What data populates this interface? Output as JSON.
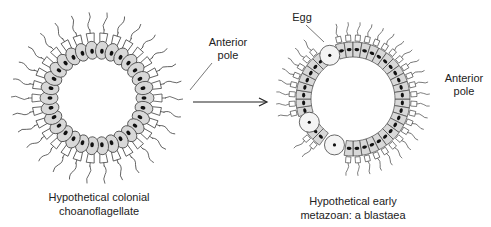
{
  "diagram": {
    "left_panel": {
      "caption_line1": "Hypothetical colonial",
      "caption_line2": "choanoflagellate",
      "label_anterior_line1": "Anterior",
      "label_anterior_line2": "pole",
      "ring": {
        "cx": 97,
        "cy": 98,
        "radius": 46,
        "cell_count": 30
      }
    },
    "arrow": {
      "x1": 193,
      "y1": 102,
      "x2": 266,
      "y2": 102,
      "direction": "right"
    },
    "right_panel": {
      "caption_line1": "Hypothetical early",
      "caption_line2": "metazoan: a blastaea",
      "label_egg": "Egg",
      "label_anterior_line1": "Anterior",
      "label_anterior_line2": "pole",
      "ring": {
        "cx": 353,
        "cy": 99,
        "inner_radius": 42,
        "outer_radius": 57,
        "cell_count": 40,
        "egg_angles_deg": [
          -118,
          152,
          112
        ]
      }
    },
    "colors": {
      "cell_fill": "#d8d8d8",
      "cell_stroke": "#444444",
      "nucleus": "#111111",
      "egg_fill": "#f4f4f4",
      "line": "#333333"
    }
  }
}
